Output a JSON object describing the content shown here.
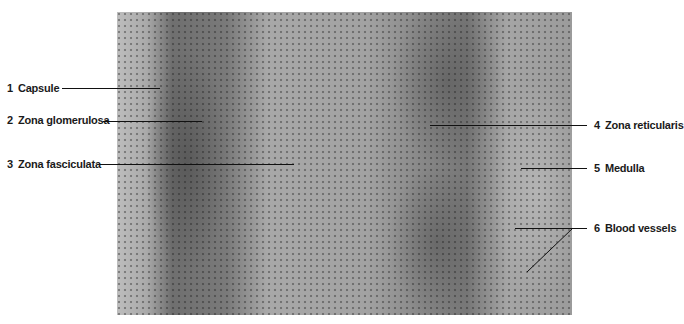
{
  "figure": {
    "labels": [
      {
        "number": "1",
        "text": "Capsule"
      },
      {
        "number": "2",
        "text": "Zona glomerulosa"
      },
      {
        "number": "3",
        "text": "Zona fasciculata"
      },
      {
        "number": "4",
        "text": "Zona reticularis"
      },
      {
        "number": "5",
        "text": "Medulla"
      },
      {
        "number": "6",
        "text": "Blood vessels"
      }
    ]
  }
}
